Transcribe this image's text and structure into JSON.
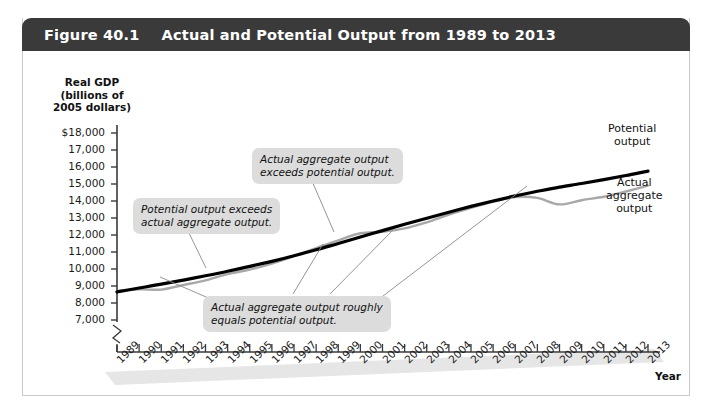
{
  "header": {
    "figure_number": "Figure 40.1",
    "title": "Actual and Potential Output from 1989 to 2013"
  },
  "chart_data": {
    "type": "line",
    "title": "Actual and Potential Output from 1989 to 2013",
    "xlabel": "Year",
    "ylabel": "Real GDP (billions of 2005 dollars)",
    "ylabel_lines": [
      "Real GDP",
      "(billions of",
      "2005 dollars)"
    ],
    "grid": false,
    "axis_break": true,
    "ylim": [
      7000,
      18000
    ],
    "ytick_labels": [
      "$18,000",
      "17,000",
      "16,000",
      "15,000",
      "14,000",
      "13,000",
      "12,000",
      "11,000",
      "10,000",
      "9,000",
      "8,000",
      "7,000"
    ],
    "yticks": [
      18000,
      17000,
      16000,
      15000,
      14000,
      13000,
      12000,
      11000,
      10000,
      9000,
      8000,
      7000
    ],
    "categories": [
      1989,
      1990,
      1991,
      1992,
      1993,
      1994,
      1995,
      1996,
      1997,
      1998,
      1999,
      2000,
      2001,
      2002,
      2003,
      2004,
      2005,
      2006,
      2007,
      2008,
      2009,
      2010,
      2011,
      2012,
      2013
    ],
    "xtick_labels": [
      "1989",
      "1990",
      "1991",
      "1992",
      "1993",
      "1994",
      "1995",
      "1996",
      "1997",
      "1998",
      "1999",
      "2000",
      "2001",
      "2002",
      "2003",
      "2004",
      "2005",
      "2006",
      "2007",
      "2008",
      "2009",
      "2010",
      "2011",
      "2012",
      "2013"
    ],
    "series": [
      {
        "name": "Potential output",
        "color": "#000000",
        "width": 3.2,
        "values": [
          8650,
          8880,
          9110,
          9350,
          9600,
          9870,
          10150,
          10450,
          10780,
          11130,
          11500,
          11880,
          12260,
          12630,
          12990,
          13340,
          13680,
          14000,
          14300,
          14570,
          14810,
          15030,
          15260,
          15500,
          15760
        ]
      },
      {
        "name": "Actual aggregate output",
        "color": "#a8a8a8",
        "width": 2.4,
        "values": [
          8700,
          8800,
          8790,
          9060,
          9330,
          9700,
          9960,
          10320,
          10760,
          11230,
          11690,
          12100,
          12190,
          12390,
          12750,
          13200,
          13600,
          13950,
          14230,
          14180,
          13800,
          14050,
          14250,
          14560,
          14900
        ]
      }
    ],
    "annotations": [
      {
        "id": "potential-exceeds-actual",
        "text_lines": [
          "Potential output exceeds",
          "actual aggregate output."
        ],
        "box": {
          "left": 133,
          "top": 198
        },
        "leader": {
          "x1": 188,
          "y1": 231,
          "x2": 206,
          "y2": 268
        }
      },
      {
        "id": "actual-exceeds-potential",
        "text_lines": [
          "Actual aggregate output",
          "exceeds potential output."
        ],
        "box": {
          "left": 252,
          "top": 148
        },
        "leader": {
          "x1": 312,
          "y1": 181,
          "x2": 334,
          "y2": 232
        }
      },
      {
        "id": "actual-equals-potential",
        "text_lines": [
          "Actual aggregate output roughly",
          "equals potential output."
        ],
        "box": {
          "left": 203,
          "top": 296
        },
        "leaders": [
          {
            "x1": 213,
            "y1": 300,
            "x2": 160,
            "y2": 277
          },
          {
            "x1": 293,
            "y1": 294,
            "x2": 323,
            "y2": 244
          },
          {
            "x1": 330,
            "y1": 294,
            "x2": 393,
            "y2": 230
          },
          {
            "x1": 383,
            "y1": 296,
            "x2": 527,
            "y2": 186
          }
        ]
      }
    ],
    "series_labels": [
      {
        "id": "potential-output-label",
        "text_lines": [
          "Potential",
          "output"
        ],
        "left": 608,
        "top": 122
      },
      {
        "id": "actual-output-label",
        "text_lines": [
          "Actual",
          "aggregate",
          "output"
        ],
        "left": 606,
        "top": 176
      }
    ]
  }
}
